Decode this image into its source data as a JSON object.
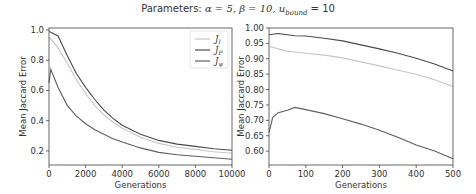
{
  "suptitle": "Parameters: α = 5, β = 10, u_bound = 10",
  "suptitle_parts": {
    "prefix": "Parameters: ",
    "alpha": "α = 5, ",
    "beta": "β = 10, ",
    "u": "u",
    "u_sub": "bound",
    "u_val": " = 10"
  },
  "colors": {
    "J_I": "#c6c6c6",
    "J_P": "#4a4a4a",
    "J_psi": "#5e5e5e",
    "axis": "#444444"
  },
  "chart_data": [
    {
      "type": "line",
      "title": "",
      "xlabel": "Generations",
      "ylabel": "Mean Jaccard Error",
      "xlim": [
        0,
        10000
      ],
      "ylim": [
        0.107,
        1.013
      ],
      "xticks": [
        0,
        2000,
        4000,
        6000,
        8000,
        10000
      ],
      "xtick_labels": [
        "0",
        "2000",
        "4000",
        "6000",
        "8000",
        "10000"
      ],
      "yticks": [
        0.2,
        0.4,
        0.6,
        0.8,
        1.0
      ],
      "ytick_labels": [
        "0.2",
        "0.4",
        "0.6",
        "0.8",
        "1.0"
      ],
      "grid": false,
      "legend_position": "upper right",
      "x": [
        0,
        100,
        500,
        1000,
        1500,
        2000,
        2500,
        3000,
        3500,
        4000,
        5000,
        6000,
        7000,
        8000,
        9000,
        10000
      ],
      "series": [
        {
          "name": "J_I",
          "label": "J_I",
          "values": [
            0.95,
            0.94,
            0.88,
            0.78,
            0.67,
            0.58,
            0.5,
            0.44,
            0.39,
            0.35,
            0.29,
            0.25,
            0.225,
            0.21,
            0.195,
            0.185
          ]
        },
        {
          "name": "J_P",
          "label": "J_P",
          "values": [
            0.99,
            0.985,
            0.96,
            0.83,
            0.71,
            0.62,
            0.54,
            0.47,
            0.415,
            0.37,
            0.31,
            0.27,
            0.245,
            0.23,
            0.215,
            0.205
          ]
        },
        {
          "name": "J_psi",
          "label": "J_ψ",
          "values": [
            0.65,
            0.74,
            0.62,
            0.5,
            0.43,
            0.38,
            0.34,
            0.31,
            0.28,
            0.26,
            0.22,
            0.19,
            0.175,
            0.165,
            0.155,
            0.145
          ]
        }
      ]
    },
    {
      "type": "line",
      "title": "",
      "xlabel": "Generations",
      "ylabel": "Mean Jaccard Error",
      "xlim": [
        0,
        500
      ],
      "ylim": [
        0.555,
        1.0
      ],
      "xticks": [
        0,
        100,
        200,
        300,
        400,
        500
      ],
      "xtick_labels": [
        "0",
        "100",
        "200",
        "300",
        "400",
        "500"
      ],
      "yticks": [
        0.6,
        0.65,
        0.7,
        0.75,
        0.8,
        0.85,
        0.9,
        0.95,
        1.0
      ],
      "ytick_labels": [
        "0.60",
        "0.65",
        "0.70",
        "0.75",
        "0.80",
        "0.85",
        "0.90",
        "0.95",
        "1.00"
      ],
      "grid": false,
      "x": [
        0,
        10,
        25,
        50,
        70,
        100,
        150,
        200,
        250,
        300,
        350,
        400,
        450,
        500
      ],
      "series": [
        {
          "name": "J_I",
          "values": [
            0.94,
            0.938,
            0.932,
            0.925,
            0.922,
            0.918,
            0.912,
            0.903,
            0.89,
            0.877,
            0.863,
            0.85,
            0.832,
            0.81
          ]
        },
        {
          "name": "J_P",
          "values": [
            0.978,
            0.98,
            0.982,
            0.978,
            0.975,
            0.974,
            0.967,
            0.958,
            0.945,
            0.932,
            0.918,
            0.902,
            0.883,
            0.86
          ]
        },
        {
          "name": "J_psi",
          "values": [
            0.66,
            0.71,
            0.725,
            0.733,
            0.742,
            0.735,
            0.722,
            0.705,
            0.688,
            0.668,
            0.645,
            0.62,
            0.6,
            0.575
          ]
        }
      ]
    }
  ]
}
